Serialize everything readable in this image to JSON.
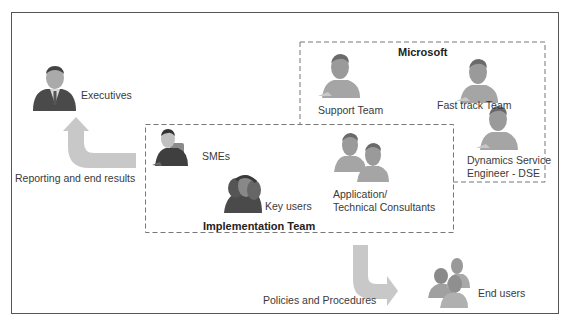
{
  "diagram": {
    "groups": {
      "microsoft": {
        "title": "Microsoft"
      },
      "implementation": {
        "title": "Implementation Team"
      }
    },
    "nodes": {
      "executives": {
        "label": "Executives",
        "icon": "executive-icon"
      },
      "support_team": {
        "label": "Support Team",
        "icon": "user-icon"
      },
      "fast_track_team": {
        "label": "Fast track Team",
        "icon": "user-icon"
      },
      "dse": {
        "label_line1": "Dynamics Service",
        "label_line2": "Engineer - DSE",
        "icon": "user-icon"
      },
      "smes": {
        "label": "SMEs",
        "icon": "business-user-icon"
      },
      "key_users": {
        "label": "Key users",
        "icon": "user-group-icon"
      },
      "consultants": {
        "label_line1": "Application/",
        "label_line2": "Technical Consultants",
        "icon": "two-users-icon"
      },
      "end_users": {
        "label": "End users",
        "icon": "users-group-icon"
      }
    },
    "flows": {
      "reporting": {
        "label": "Reporting and end results",
        "from": "Implementation Team",
        "to": "Executives"
      },
      "policies": {
        "label": "Policies and Procedures",
        "from": "Implementation Team",
        "to": "End users"
      }
    },
    "colors": {
      "border": "#555555",
      "dashed_border": "#777777",
      "arrow": "#c8c8c8",
      "icon_fill": "#9a9a9a",
      "icon_shirt": "#b8b8b8"
    }
  }
}
